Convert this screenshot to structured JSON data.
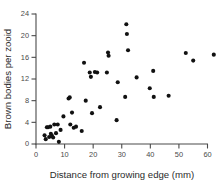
{
  "chart_data": {
    "type": "scatter",
    "title": "",
    "xlabel": "Distance from growing edge (mm)",
    "ylabel": "Brown bodies per zooid",
    "xlim": [
      0,
      63
    ],
    "ylim": [
      0,
      24
    ],
    "xticks": [
      0,
      10,
      20,
      30,
      40,
      50,
      60
    ],
    "yticks": [
      0,
      4,
      8,
      12,
      16,
      20,
      24
    ],
    "grid": false,
    "legend": null,
    "marker": "filled-circle",
    "marker_color": "#111111",
    "series": [
      {
        "name": "brown bodies per zooid",
        "points": [
          [
            3.0,
            1.6
          ],
          [
            3.4,
            0.9
          ],
          [
            3.8,
            3.1
          ],
          [
            4.2,
            3.1
          ],
          [
            4.6,
            1.3
          ],
          [
            5.0,
            3.2
          ],
          [
            5.2,
            1.9
          ],
          [
            5.6,
            1.5
          ],
          [
            6.0,
            1.2
          ],
          [
            6.4,
            3.6
          ],
          [
            7.0,
            2.0
          ],
          [
            7.6,
            3.6
          ],
          [
            8.0,
            0.4
          ],
          [
            8.6,
            2.6
          ],
          [
            9.6,
            5.1
          ],
          [
            11.4,
            8.4
          ],
          [
            11.8,
            8.6
          ],
          [
            12.0,
            3.6
          ],
          [
            12.6,
            5.8
          ],
          [
            13.2,
            3.0
          ],
          [
            14.0,
            3.2
          ],
          [
            16.0,
            2.4
          ],
          [
            16.8,
            15.0
          ],
          [
            17.4,
            8.0
          ],
          [
            18.8,
            13.2
          ],
          [
            19.2,
            12.4
          ],
          [
            19.6,
            5.7
          ],
          [
            20.6,
            13.3
          ],
          [
            21.4,
            13.2
          ],
          [
            22.4,
            6.8
          ],
          [
            24.8,
            13.2
          ],
          [
            25.2,
            16.9
          ],
          [
            25.4,
            16.3
          ],
          [
            28.2,
            4.4
          ],
          [
            28.6,
            11.4
          ],
          [
            31.2,
            8.7
          ],
          [
            31.6,
            22.1
          ],
          [
            31.8,
            20.3
          ],
          [
            32.2,
            17.3
          ],
          [
            35.2,
            12.3
          ],
          [
            39.8,
            10.3
          ],
          [
            41.0,
            13.5
          ],
          [
            41.2,
            8.7
          ],
          [
            46.4,
            8.9
          ],
          [
            52.4,
            16.8
          ],
          [
            55.0,
            15.4
          ],
          [
            62.2,
            16.5
          ]
        ]
      }
    ]
  }
}
